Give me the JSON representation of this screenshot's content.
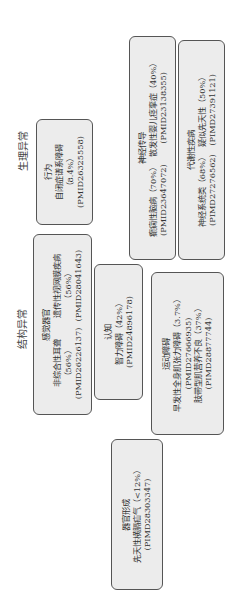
{
  "orientation": "rotated -90deg (text reads bottom-to-top)",
  "categories": {
    "physiological": "生理异常",
    "structural": "结构异常"
  },
  "boxes": {
    "behavior": {
      "title": "行为",
      "items": [
        {
          "name": "自闭症谱系障碍",
          "pct": "（8.4%）",
          "pmid": "(PMID26325558)"
        }
      ]
    },
    "neuro": {
      "title": "神经传导",
      "items": [
        {
          "name": "癫痫性脑病（70%）",
          "pmid": "(PMID23647072)"
        },
        {
          "name": "散发性婴儿痉挛症（40%）",
          "pmid": "(PMID23138355)"
        }
      ]
    },
    "metabolic": {
      "title": "代谢性疾病",
      "items": [
        {
          "name": "神经系统类（68%）",
          "pmid": "(PIMD27276562)"
        },
        {
          "name": "疑似先天性（50%）",
          "pmid": "(PIMD27391121)"
        }
      ]
    },
    "sensory": {
      "title": "感觉器官",
      "items": [
        {
          "name": "非综合性耳聋",
          "pct": "（56%）",
          "pmid": "(PMID26226137)"
        },
        {
          "name": "遗传性视网膜疾病",
          "pct": "（56%）",
          "pmid": "(PMID28041643)"
        }
      ]
    },
    "cognition": {
      "title": "认知",
      "items": [
        {
          "name": "智力障碍（42%）",
          "pmid": "(PMID24896178)"
        }
      ]
    },
    "motor": {
      "title": "运动障碍",
      "items": [
        {
          "name": "早发性全身肌张力障碍（3.7%）",
          "pmid": "(PMID27666935)"
        },
        {
          "name": "肢带型肌营养不良（37%）",
          "pmid": "(PIMD28877744)"
        }
      ]
    },
    "organogenesis": {
      "title": "器官形成",
      "items": [
        {
          "name": "先天性横膈疝气（<12%）",
          "pmid": "(PIMD28303347)"
        }
      ]
    }
  }
}
